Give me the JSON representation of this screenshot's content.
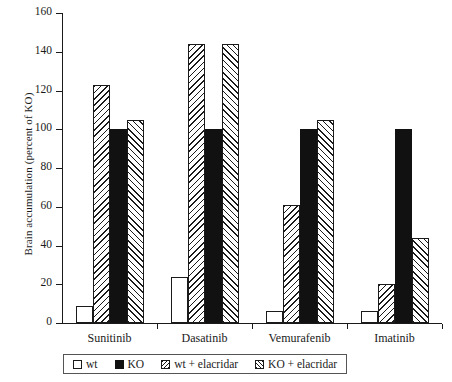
{
  "chart_data": {
    "type": "bar",
    "title": "",
    "xlabel": "",
    "ylabel": "Brain accumulation (percent of KO)",
    "ylim": [
      0,
      160
    ],
    "yticks": [
      0,
      20,
      40,
      60,
      80,
      100,
      120,
      140,
      160
    ],
    "ytick_labels": [
      "0",
      "20",
      "40",
      "60",
      "80",
      "100",
      "120",
      "140",
      "160"
    ],
    "grid": false,
    "legend_position": "bottom",
    "categories": [
      "Sunitinib",
      "Dasatinib",
      "Vemurafenib",
      "Imatinib"
    ],
    "series": [
      {
        "name": "wt",
        "pattern": "open",
        "values": [
          9,
          24,
          6,
          6
        ]
      },
      {
        "name": "wt + elacridar",
        "pattern": "hatch-backslash",
        "values": [
          123,
          144,
          61,
          20
        ]
      },
      {
        "name": "KO",
        "pattern": "solid-black",
        "values": [
          100,
          100,
          100,
          100
        ]
      },
      {
        "name": "KO + elacridar",
        "pattern": "hatch-forwardslash",
        "values": [
          105,
          144,
          105,
          44
        ]
      }
    ],
    "legend": [
      {
        "label": "wt",
        "swatch": "open"
      },
      {
        "label": "KO",
        "swatch": "solid-black"
      },
      {
        "label": "wt + elacridar",
        "swatch": "hatch-backslash"
      },
      {
        "label": "KO + elacridar",
        "swatch": "hatch-forwardslash"
      }
    ],
    "colors": {
      "ink": "#1a1a1a",
      "fill_open": "#ffffff",
      "fill_solid": "#111111",
      "background": "#ffffff"
    }
  }
}
